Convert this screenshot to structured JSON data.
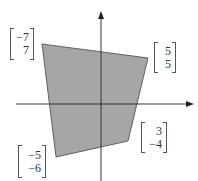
{
  "figure": {
    "fill_color": "#a6a6a6",
    "axis_color": "#333333",
    "vertices": [
      {
        "name": "top-left",
        "label": [
          "−7",
          "7"
        ]
      },
      {
        "name": "top-right",
        "label": [
          "5",
          "5"
        ]
      },
      {
        "name": "bottom-right",
        "label": [
          "3",
          "−4"
        ]
      },
      {
        "name": "bottom-left",
        "label": [
          "−5",
          "−6"
        ]
      }
    ]
  }
}
